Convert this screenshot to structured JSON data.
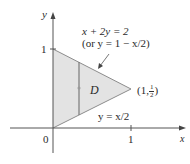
{
  "diagram": {
    "type": "region-of-integration",
    "axes": {
      "x_label": "x",
      "y_label": "y",
      "origin_label": "0",
      "x_tick_label": "1",
      "y_tick_label": "1"
    },
    "region": {
      "label": "D",
      "fill_color": "#e3e3e3",
      "edge_color": "#8c8c8c",
      "vertices": [
        [
          0,
          0
        ],
        [
          0,
          1
        ],
        [
          1,
          0.5
        ]
      ]
    },
    "curves": {
      "upper": {
        "equation_line1": "x + 2y = 2",
        "equation_line2": "(or y = 1 − x/2)"
      },
      "lower": {
        "equation": "y = x/2"
      }
    },
    "point": {
      "open": "(",
      "x": "1,",
      "frac_num": "1",
      "frac_den": "2",
      "close": ")"
    },
    "strip": {
      "color": "#7a7a7a"
    },
    "axis_color": "#555555",
    "text_color": "#2a2a2a"
  }
}
